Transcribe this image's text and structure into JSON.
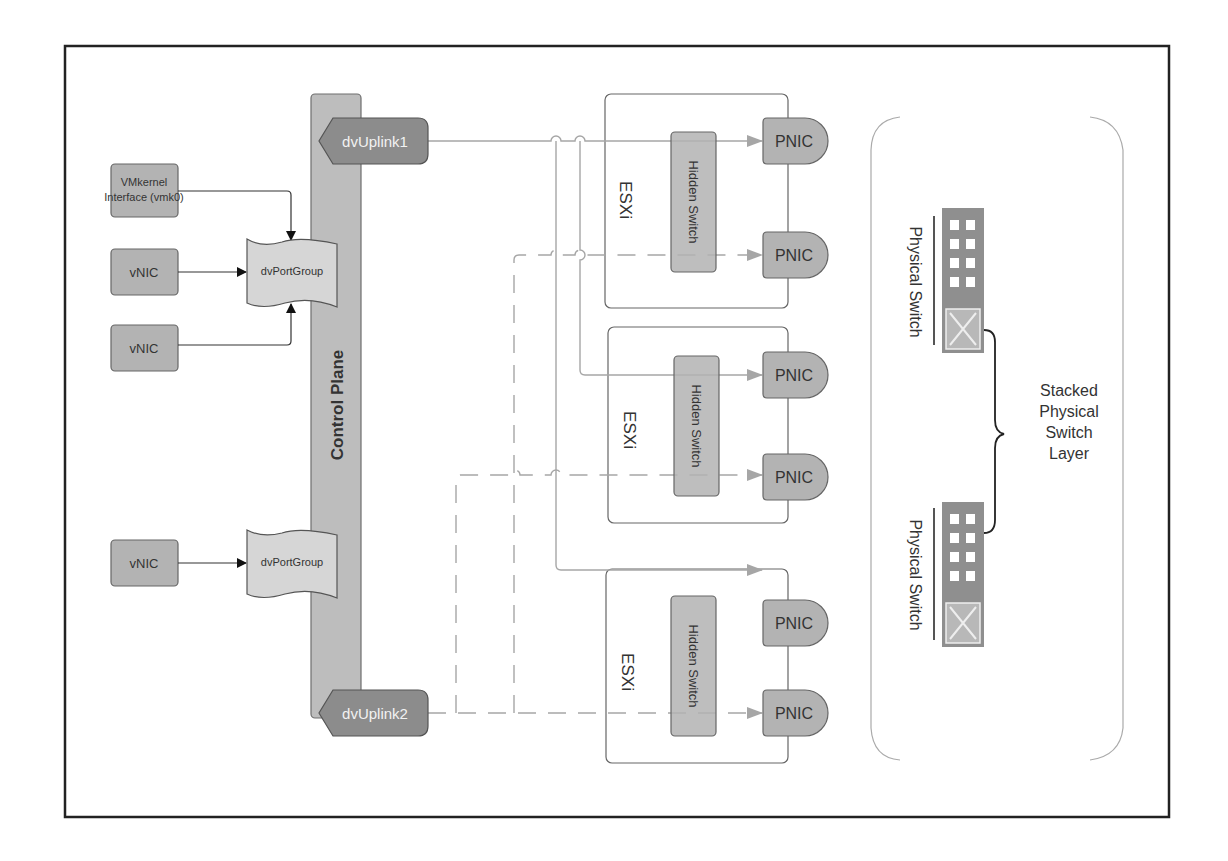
{
  "diagram": {
    "control_plane": {
      "label": "Control Plane"
    },
    "uplinks": [
      {
        "label": "dvUplink1",
        "style": "solid"
      },
      {
        "label": "dvUplink2",
        "style": "dashed"
      }
    ],
    "vmkernel": {
      "label_line1": "VMkernel",
      "label_line2": "Interface (vmk0)"
    },
    "vnics": [
      {
        "label": "vNIC"
      },
      {
        "label": "vNIC"
      },
      {
        "label": "vNIC"
      }
    ],
    "portgroups": [
      {
        "label": "dvPortGroup"
      },
      {
        "label": "dvPortGroup"
      }
    ],
    "hosts": [
      {
        "label": "ESXi",
        "switch_label": "Hidden Switch",
        "pnics": [
          "PNIC",
          "PNIC"
        ]
      },
      {
        "label": "ESXi",
        "switch_label": "Hidden Switch",
        "pnics": [
          "PNIC",
          "PNIC"
        ]
      },
      {
        "label": "ESXi",
        "switch_label": "Hidden Switch",
        "pnics": [
          "PNIC",
          "PNIC"
        ]
      }
    ],
    "physical_switches": [
      {
        "label": "Physical Switch"
      },
      {
        "label": "Physical Switch"
      }
    ],
    "stack_label": {
      "line1": "Stacked",
      "line2": "Physical",
      "line3": "Switch",
      "line4": "Layer"
    },
    "colors": {
      "box_fill": "#b3b3b3",
      "box_stroke": "#666666",
      "uplink_fill": "#8c8c8c",
      "control_plane_fill": "#bdbdbd",
      "portgroup_fill": "#d6d6d6",
      "switch_fill": "#8f8f8f",
      "line": "#a6a6a6",
      "frame": "#222222"
    }
  }
}
